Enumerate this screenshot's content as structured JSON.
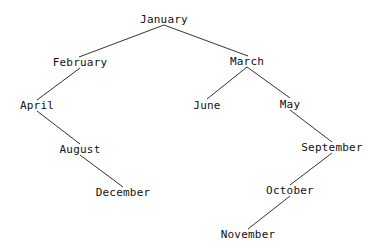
{
  "diagram": {
    "type": "binary-tree",
    "nodes": [
      {
        "id": "january",
        "label": "January",
        "x": 164,
        "y": 19
      },
      {
        "id": "february",
        "label": "February",
        "x": 80,
        "y": 62
      },
      {
        "id": "march",
        "label": "March",
        "x": 247,
        "y": 61
      },
      {
        "id": "april",
        "label": "April",
        "x": 37,
        "y": 105
      },
      {
        "id": "june",
        "label": "June",
        "x": 207,
        "y": 105
      },
      {
        "id": "may",
        "label": "May",
        "x": 290,
        "y": 104
      },
      {
        "id": "august",
        "label": "August",
        "x": 80,
        "y": 149
      },
      {
        "id": "september",
        "label": "September",
        "x": 332,
        "y": 147
      },
      {
        "id": "december",
        "label": "December",
        "x": 123,
        "y": 192
      },
      {
        "id": "october",
        "label": "October",
        "x": 290,
        "y": 190
      },
      {
        "id": "november",
        "label": "November",
        "x": 248,
        "y": 234
      }
    ],
    "edges": [
      {
        "from": "january",
        "to": "february"
      },
      {
        "from": "january",
        "to": "march"
      },
      {
        "from": "february",
        "to": "april"
      },
      {
        "from": "march",
        "to": "june"
      },
      {
        "from": "march",
        "to": "may"
      },
      {
        "from": "april",
        "to": "august"
      },
      {
        "from": "august",
        "to": "december"
      },
      {
        "from": "may",
        "to": "september"
      },
      {
        "from": "september",
        "to": "october"
      },
      {
        "from": "october",
        "to": "november"
      }
    ]
  }
}
